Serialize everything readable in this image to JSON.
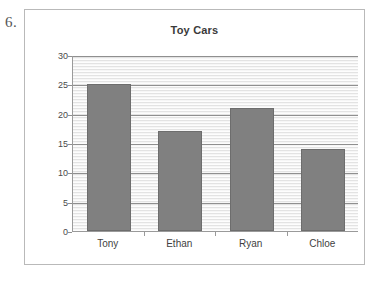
{
  "question_number": "6.",
  "chart_data": {
    "type": "bar",
    "title": "Toy Cars",
    "xlabel": "",
    "ylabel": "",
    "categories": [
      "Tony",
      "Ethan",
      "Ryan",
      "Chloe"
    ],
    "values": [
      25,
      17,
      21,
      14
    ],
    "ylim": [
      0,
      30
    ],
    "y_ticks": [
      0,
      5,
      10,
      15,
      20,
      25,
      30
    ],
    "y_tick_labels": [
      "0",
      "5",
      "10",
      "15",
      "20",
      "25",
      "30"
    ],
    "grid": true,
    "legend": null,
    "bar_color": "#808080",
    "plot_background": "#f4f4f4",
    "gridline_color": "#8f8f8f",
    "axis_color": "#9a9a9a",
    "frame_color": "#b9b9b9"
  }
}
